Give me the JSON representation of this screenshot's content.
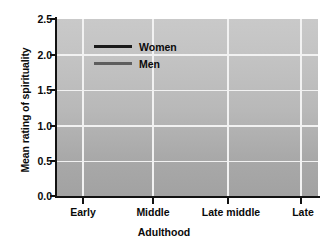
{
  "chart_data": {
    "type": "line",
    "title": "",
    "xlabel": "Adulthood",
    "ylabel": "Mean rating of spirituality",
    "categories": [
      "Early",
      "Middle",
      "Late middle",
      "Late"
    ],
    "yticks": [
      "0.0",
      "0.5",
      "1.0",
      "1.5",
      "2.0",
      "2.5"
    ],
    "ylim": [
      0.0,
      2.5
    ],
    "grid": true,
    "legend_position": "upper-left-inside",
    "series": [
      {
        "name": "Women",
        "color": "#1a1a1a",
        "values": [
          1.3,
          1.35,
          1.56,
          2.25
        ]
      },
      {
        "name": "Men",
        "color": "#5e5e5e",
        "values": [
          1.15,
          1.29,
          1.29,
          1.62
        ]
      }
    ]
  },
  "axes": {
    "y_title": "Mean rating of spirituality",
    "x_title": "Adulthood",
    "y_tick_labels": [
      "2.5",
      "2.0",
      "1.5",
      "1.0",
      "0.5",
      "0.0"
    ],
    "x_tick_labels": [
      "Early",
      "Middle",
      "Late middle",
      "Late"
    ]
  },
  "legend": {
    "entries": [
      {
        "label": "Women",
        "color": "#1a1a1a"
      },
      {
        "label": "Men",
        "color": "#5e5e5e"
      }
    ]
  },
  "colors": {
    "plot_background_top": "#c9c9c9",
    "plot_background_bottom": "#a2a2a2",
    "gridline": "#f2f2f2",
    "axis": "#121212",
    "women_line": "#1a1a1a",
    "men_line": "#5e5e5e",
    "page_background": "#ffffff"
  }
}
